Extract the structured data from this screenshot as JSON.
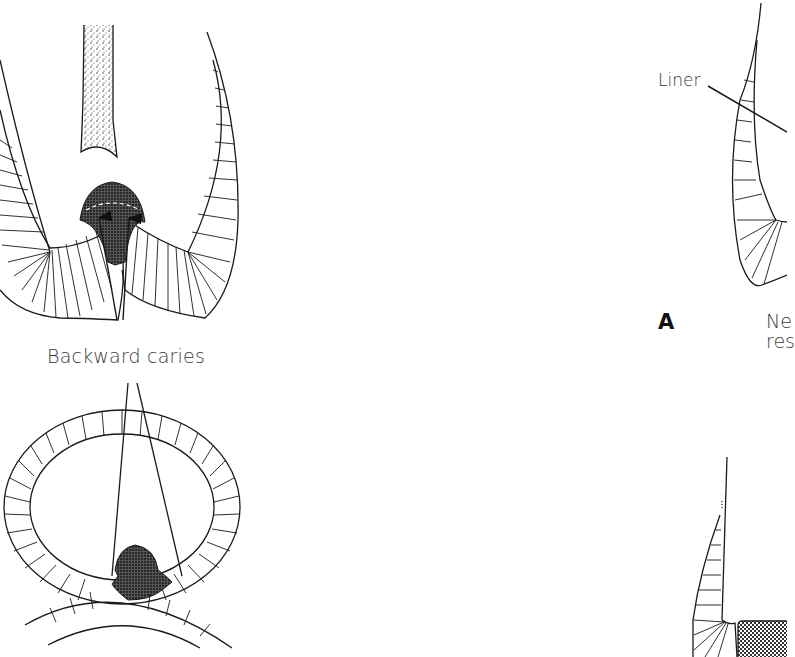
{
  "figure": {
    "panels": [
      {
        "id": "top-left",
        "description": "Tooth cross-section (sagittal) showing caries spreading from enamel into dentin, with arrows indicating backward caries",
        "label": "Backward caries"
      },
      {
        "id": "bottom-left",
        "description": "Occlusal/transverse tooth cross-section showing caries lesion at contact point with adjacent tooth",
        "label": ""
      },
      {
        "id": "top-right",
        "description": "Tooth section with liner indicated (partially cropped)",
        "label": "Liner",
        "panel_letter": "A",
        "caption_fragment_line1": "N",
        "caption_fragment_line2": "res"
      },
      {
        "id": "bottom-right",
        "description": "Tooth section with restoration material (stippled block), partially cropped",
        "label": ""
      }
    ]
  },
  "labels": {
    "backward_caries": "Backward caries",
    "liner": "Liner",
    "panel_a": "A",
    "caption_line1": "Ne",
    "caption_line2": "res"
  },
  "colors": {
    "line": "#1a1a1a",
    "text": "#3a3a3a",
    "background": "#ffffff"
  }
}
